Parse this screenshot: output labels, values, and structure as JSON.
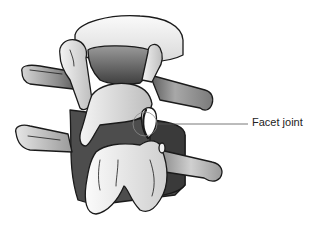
{
  "figure": {
    "labels": [
      {
        "id": "facet-joint",
        "text": "Facet joint"
      }
    ]
  },
  "colors": {
    "outline": "#1a1a1a",
    "bone_light": "#f2f2f2",
    "bone_mid": "#c8c8c8",
    "bone_dark": "#6e6e6e",
    "shadow": "#5a5a5a",
    "leader": "#555555",
    "label_text": "#222222"
  }
}
